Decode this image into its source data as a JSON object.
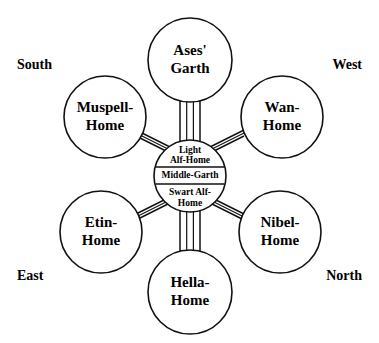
{
  "diagram": {
    "background_color": "#ffffff",
    "stroke_color": "#111111",
    "hub": {
      "name": "middle-garth-hub",
      "bands": [
        {
          "id": "light-alf-home",
          "line1": "Light",
          "line2": "Alf-Home"
        },
        {
          "id": "middle-garth",
          "line1": "Middle-Garth",
          "line2": ""
        },
        {
          "id": "swart-alf-home",
          "line1": "Swart Alf-",
          "line2": "Home"
        }
      ]
    },
    "realms": [
      {
        "id": "ases-garth",
        "line1": "Ases'",
        "line2": "Garth",
        "position": "top"
      },
      {
        "id": "wan-home",
        "line1": "Wan-",
        "line2": "Home",
        "position": "upper-right"
      },
      {
        "id": "nibel-home",
        "line1": "Nibel-",
        "line2": "Home",
        "position": "lower-right"
      },
      {
        "id": "hella-home",
        "line1": "Hella-",
        "line2": "Home",
        "position": "bottom"
      },
      {
        "id": "etin-home",
        "line1": "Etin-",
        "line2": "Home",
        "position": "lower-left"
      },
      {
        "id": "muspell-home",
        "line1": "Muspell-",
        "line2": "Home",
        "position": "upper-left"
      }
    ],
    "compass": [
      {
        "id": "south",
        "label": "South",
        "corner": "top-left"
      },
      {
        "id": "west",
        "label": "West",
        "corner": "top-right"
      },
      {
        "id": "east",
        "label": "East",
        "corner": "bottom-left"
      },
      {
        "id": "north",
        "label": "North",
        "corner": "bottom-right"
      }
    ]
  }
}
